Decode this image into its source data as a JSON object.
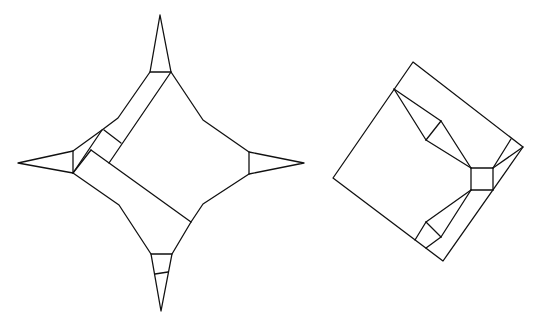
{
  "canvas": {
    "width": 539,
    "height": 322,
    "background": "#ffffff",
    "stroke": "#111111"
  },
  "figures": [
    {
      "name": "four-point-star-fold",
      "outline": [
        [
          160,
          15
        ],
        [
          171,
          72
        ],
        [
          203,
          120
        ],
        [
          249,
          152
        ],
        [
          304,
          163
        ],
        [
          249,
          174
        ],
        [
          203,
          204
        ],
        [
          191,
          222
        ],
        [
          172,
          254
        ],
        [
          161,
          311
        ],
        [
          151,
          254
        ],
        [
          119,
          205
        ],
        [
          73,
          173
        ],
        [
          18,
          163
        ],
        [
          73,
          151
        ],
        [
          102,
          130
        ],
        [
          118,
          118
        ],
        [
          150,
          72
        ]
      ],
      "segments": [
        [
          [
            150,
            72
          ],
          [
            171,
            72
          ]
        ],
        [
          [
            73,
            151
          ],
          [
            73,
            173
          ]
        ],
        [
          [
            249,
            152
          ],
          [
            249,
            174
          ]
        ],
        [
          [
            151,
            254
          ],
          [
            172,
            254
          ]
        ],
        [
          [
            155,
            274
          ],
          [
            168,
            272
          ]
        ],
        [
          [
            171,
            72
          ],
          [
            109,
            163
          ]
        ],
        [
          [
            73,
            173
          ],
          [
            102,
            130
          ]
        ],
        [
          [
            104,
            130
          ],
          [
            121,
            143
          ]
        ],
        [
          [
            91,
            150
          ],
          [
            191,
            222
          ]
        ],
        [
          [
            91,
            150
          ],
          [
            73,
            173
          ]
        ]
      ]
    },
    {
      "name": "square-base-fold",
      "outline": [
        [
          413,
          62
        ],
        [
          523,
          147
        ],
        [
          443,
          261
        ],
        [
          333,
          178
        ]
      ],
      "segments": [
        [
          [
            394,
            89
          ],
          [
            441,
            121
          ]
        ],
        [
          [
            394,
            89
          ],
          [
            426,
            140
          ]
        ],
        [
          [
            441,
            121
          ],
          [
            426,
            140
          ]
        ],
        [
          [
            441,
            121
          ],
          [
            471,
            168
          ]
        ],
        [
          [
            426,
            140
          ],
          [
            471,
            168
          ]
        ],
        [
          [
            471,
            168
          ],
          [
            493,
            168
          ]
        ],
        [
          [
            493,
            168
          ],
          [
            493,
            190
          ]
        ],
        [
          [
            493,
            190
          ],
          [
            471,
            190
          ]
        ],
        [
          [
            471,
            190
          ],
          [
            471,
            168
          ]
        ],
        [
          [
            493,
            168
          ],
          [
            511,
            139
          ]
        ],
        [
          [
            493,
            168
          ],
          [
            523,
            147
          ]
        ],
        [
          [
            471,
            190
          ],
          [
            426,
            222
          ]
        ],
        [
          [
            471,
            190
          ],
          [
            441,
            237
          ]
        ],
        [
          [
            426,
            222
          ],
          [
            441,
            237
          ]
        ],
        [
          [
            426,
            222
          ],
          [
            415,
            240
          ]
        ],
        [
          [
            441,
            237
          ],
          [
            426,
            248
          ]
        ]
      ]
    }
  ]
}
